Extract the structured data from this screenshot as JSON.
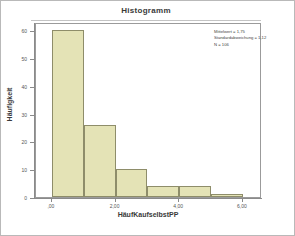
{
  "chart_data": {
    "type": "bar",
    "title": "Histogramm",
    "xlabel": "HäufKaufselbstPP",
    "ylabel": "Häufigkeit",
    "categories": [
      "0,5",
      "1,5",
      "2,5",
      "3,5",
      "4,5",
      "5,5"
    ],
    "values": [
      60,
      26,
      10,
      4,
      4,
      1
    ],
    "bin_edges": [
      0,
      1,
      2,
      3,
      4,
      5,
      6
    ],
    "ylim": [
      0,
      63
    ],
    "xlim": [
      -0.5,
      6.6
    ],
    "y_ticks": [
      0,
      10,
      20,
      30,
      40,
      50,
      60
    ],
    "y_tick_labels": [
      "0",
      "10",
      "20",
      "30",
      "40",
      "50",
      "60"
    ],
    "x_ticks": [
      0,
      2,
      4,
      6
    ],
    "x_tick_labels": [
      ",00",
      "2,00",
      "4,00",
      "6,00"
    ],
    "grid": false,
    "legend": false,
    "bar_color": "#e4e3b6",
    "bar_edge_color": "#8e8d6a",
    "annotations": [
      "Mittelwert = 1,75",
      "Standardabweichung = 1,12",
      "N = 106"
    ]
  },
  "stats": {
    "mean_line": "Mittelwert = 1,75",
    "sd_line": "Standardabweichung = 1,12",
    "n_line": "N = 106"
  },
  "colors": {
    "bar_fill": "#e4e3b6",
    "bar_stroke": "#8e8d6a",
    "axis": "#8a8a8a",
    "text": "#3a3a3a",
    "frame": "#b9b9b9"
  }
}
